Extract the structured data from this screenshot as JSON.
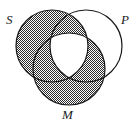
{
  "figure": {
    "type": "venn-diagram",
    "background_color": "#ffffff",
    "stroke_color": "#1a1a1a",
    "shade_color": "#2b2b2b",
    "shade_pattern": "checkered-stipple"
  },
  "labels": {
    "s": "S",
    "p": "P",
    "m": "M"
  },
  "circles": [
    {
      "id": "S",
      "label": "S",
      "cx": 52,
      "cy": 46,
      "r": 36,
      "shaded": true,
      "label_position": "top-left"
    },
    {
      "id": "P",
      "label": "P",
      "cx": 86,
      "cy": 46,
      "r": 36,
      "shaded": false,
      "label_position": "top-right"
    },
    {
      "id": "M",
      "label": "M",
      "cx": 69,
      "cy": 69,
      "r": 36,
      "shaded": true,
      "label_position": "bottom-center"
    }
  ],
  "regions": [
    {
      "id": "S-only",
      "name": "S only",
      "shaded": true
    },
    {
      "id": "P-only",
      "name": "P only",
      "shaded": false
    },
    {
      "id": "M-only",
      "name": "M only",
      "shaded": true
    },
    {
      "id": "S-and-P",
      "name": "S and P not M",
      "shaded": true
    },
    {
      "id": "S-and-M",
      "name": "S and M not P",
      "shaded": true
    },
    {
      "id": "P-and-M",
      "name": "P and M not S",
      "shaded": true
    },
    {
      "id": "S-P-M",
      "name": "S and P and M",
      "shaded": false
    }
  ]
}
